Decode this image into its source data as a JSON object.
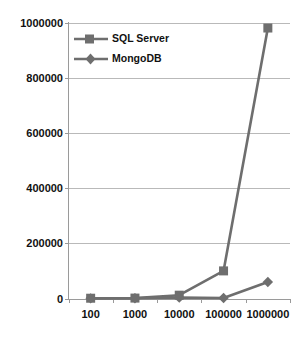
{
  "chart_data": {
    "type": "line",
    "title": "",
    "subtitle": "",
    "xlabel": "",
    "ylabel": "",
    "categories": [
      "100",
      "1000",
      "10000",
      "100000",
      "1000000"
    ],
    "ylim": [
      0,
      1000000
    ],
    "yticks": [
      "0",
      "200000",
      "400000",
      "600000",
      "800000",
      "1000000"
    ],
    "ytick_values": [
      0,
      200000,
      400000,
      600000,
      800000,
      1000000
    ],
    "grid": "horizontal",
    "legend_position": "top-left-inside",
    "series": [
      {
        "name": "SQL Server",
        "marker": "square",
        "color": "#6e6e6e",
        "values": [
          1000,
          1500,
          12000,
          100000,
          980000
        ]
      },
      {
        "name": "MongoDB",
        "marker": "diamond",
        "color": "#6e6e6e",
        "values": [
          500,
          800,
          3000,
          2000,
          60000
        ]
      }
    ]
  },
  "legend": {
    "items": [
      {
        "label": "SQL Server"
      },
      {
        "label": "MongoDB"
      }
    ]
  },
  "colors": {
    "series": "#6e6e6e",
    "grid": "#b9b9b9",
    "axis": "#9a9a9a",
    "text": "#111111",
    "background": "#ffffff"
  }
}
